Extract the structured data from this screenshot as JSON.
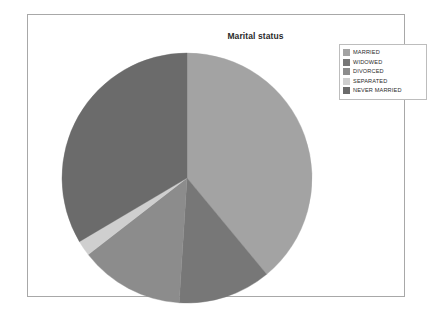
{
  "chart_data": {
    "type": "pie",
    "title": "Marital status",
    "categories": [
      "MARRIED",
      "WIDOWED",
      "DIVORCED",
      "SEPARATED",
      "NEVER MARRIED"
    ],
    "values": [
      39.0,
      12.0,
      13.5,
      2.0,
      33.5
    ],
    "colors": [
      "#a3a3a3",
      "#777777",
      "#8c8c8c",
      "#cfcfcf",
      "#6b6b6b"
    ],
    "start_angle_deg": 0,
    "direction": "clockwise",
    "legend_position": "top-right",
    "grid": false,
    "xlabel": "",
    "ylabel": "",
    "slices": [
      {
        "label": "MARRIED",
        "value": 39.0,
        "color": "#a3a3a3",
        "start_deg": 0.0,
        "sweep_deg": 140.4
      },
      {
        "label": "WIDOWED",
        "value": 12.0,
        "color": "#777777",
        "start_deg": 140.4,
        "sweep_deg": 43.2
      },
      {
        "label": "DIVORCED",
        "value": 13.5,
        "color": "#8c8c8c",
        "start_deg": 183.6,
        "sweep_deg": 48.6
      },
      {
        "label": "SEPARATED",
        "value": 2.0,
        "color": "#cfcfcf",
        "start_deg": 232.2,
        "sweep_deg": 7.2
      },
      {
        "label": "NEVER MARRIED",
        "value": 33.5,
        "color": "#6b6b6b",
        "start_deg": 239.4,
        "sweep_deg": 120.6
      }
    ]
  },
  "chart": {
    "title": "Marital status",
    "pie": {
      "center_x": 131,
      "center_y": 131,
      "radius": 125
    }
  },
  "legend": {
    "items": [
      {
        "label": "MARRIED",
        "color": "#a3a3a3"
      },
      {
        "label": "WIDOWED",
        "color": "#777777"
      },
      {
        "label": "DIVORCED",
        "color": "#8c8c8c"
      },
      {
        "label": "SEPARATED",
        "color": "#cfcfcf"
      },
      {
        "label": "NEVER MARRIED",
        "color": "#6b6b6b"
      }
    ]
  },
  "frame": {
    "border_color": "#a8a8a8",
    "background": "#ffffff"
  }
}
